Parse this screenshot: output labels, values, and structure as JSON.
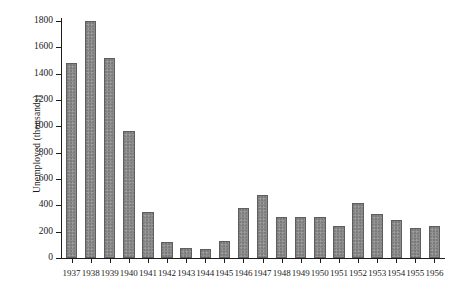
{
  "chart_data": {
    "type": "bar",
    "title": "",
    "xlabel": "",
    "ylabel": "Unemployed (thousands)",
    "categories": [
      "1937",
      "1938",
      "1939",
      "1940",
      "1941",
      "1942",
      "1943",
      "1944",
      "1945",
      "1946",
      "1947",
      "1948",
      "1949",
      "1950",
      "1951",
      "1952",
      "1953",
      "1954",
      "1955",
      "1956"
    ],
    "values": [
      1480,
      1800,
      1520,
      965,
      350,
      120,
      75,
      65,
      130,
      380,
      480,
      315,
      315,
      315,
      245,
      420,
      335,
      290,
      230,
      245
    ],
    "ylim": [
      0,
      1800
    ],
    "yticks": [
      0,
      200,
      400,
      600,
      800,
      1000,
      1200,
      1400,
      1600,
      1800
    ],
    "ytick_labels": [
      "0",
      "200",
      "400",
      "600",
      "800",
      "1000",
      "1200",
      "1400",
      "1600",
      "1800"
    ],
    "grid": false,
    "legend": null,
    "bar_color": "#8d8d8d",
    "bar_edge_color": "#5e5e5e",
    "axis_color": "#1c1c1c",
    "background_color": "#ffffff"
  }
}
